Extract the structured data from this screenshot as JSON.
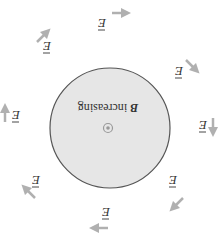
{
  "diagram": {
    "rotation_deg": 180,
    "region": {
      "fill": "#e6e6e6",
      "stroke": "#555555",
      "caption_symbol": "B",
      "caption_text": " increasing",
      "field_symbol_label": "out-of-page dot"
    },
    "field_label": "E",
    "arrow_color": "#b0b0b0",
    "arrows": [
      {
        "label": "E",
        "direction": "counterclockwise-tangent"
      },
      {
        "label": "E",
        "direction": "counterclockwise-tangent"
      },
      {
        "label": "E",
        "direction": "counterclockwise-tangent"
      },
      {
        "label": "E",
        "direction": "counterclockwise-tangent"
      },
      {
        "label": "E",
        "direction": "counterclockwise-tangent"
      },
      {
        "label": "E",
        "direction": "counterclockwise-tangent"
      },
      {
        "label": "E",
        "direction": "counterclockwise-tangent"
      },
      {
        "label": "E",
        "direction": "counterclockwise-tangent"
      }
    ]
  }
}
